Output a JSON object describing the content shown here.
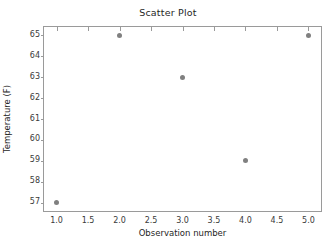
{
  "chart_data": {
    "type": "scatter",
    "title": "Scatter Plot",
    "xlabel": "Observation number",
    "ylabel": "Temperature (F)",
    "x": [
      1,
      2,
      3,
      4,
      5
    ],
    "y": [
      57,
      65,
      63,
      59,
      65
    ],
    "points": [
      {
        "x": 1,
        "y": 57
      },
      {
        "x": 2,
        "y": 65
      },
      {
        "x": 3,
        "y": 63
      },
      {
        "x": 4,
        "y": 59
      },
      {
        "x": 5,
        "y": 65
      }
    ],
    "xlim": [
      0.8,
      5.2
    ],
    "ylim": [
      56.6,
      65.4
    ],
    "xticks": [
      1.0,
      1.5,
      2.0,
      2.5,
      3.0,
      3.5,
      4.0,
      4.5,
      5.0
    ],
    "xtick_labels": [
      "1.0",
      "1.5",
      "2.0",
      "2.5",
      "3.0",
      "3.5",
      "4.0",
      "4.5",
      "5.0"
    ],
    "yticks": [
      57,
      58,
      59,
      60,
      61,
      62,
      63,
      64,
      65
    ],
    "ytick_labels": [
      "57",
      "58",
      "59",
      "60",
      "61",
      "62",
      "63",
      "64",
      "65"
    ],
    "grid": false,
    "legend": null,
    "marker_color": "#808080",
    "frame_color": "#9a9a9a",
    "background": "#ffffff"
  }
}
